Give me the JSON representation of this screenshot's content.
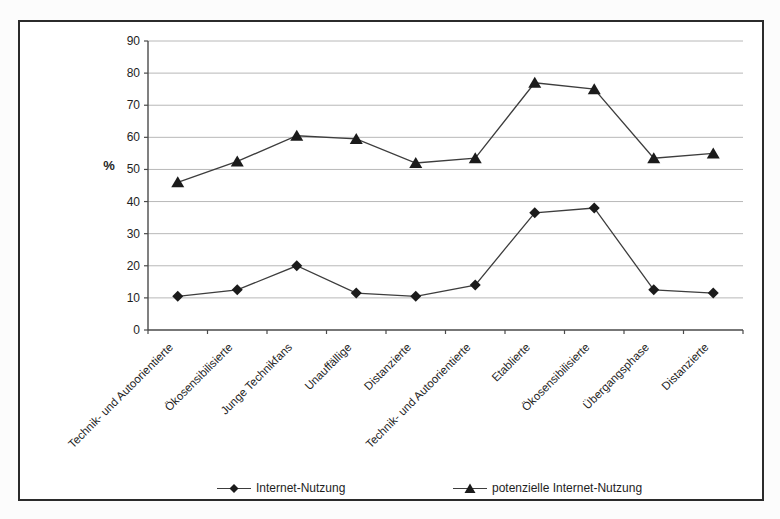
{
  "window": {
    "background": "#fcfcfc",
    "frame_border": "#2b2b2b"
  },
  "chart_data": {
    "type": "line",
    "title": "",
    "ylabel": "%",
    "xlabel": "",
    "ylim": [
      0,
      90
    ],
    "ytick_step": 10,
    "grid": true,
    "legend_position": "bottom",
    "categories": [
      "Technik- und Autoorientierte",
      "Ökosensibilisierte",
      "Junge Technikfans",
      "Unauffällige",
      "Distanzierte",
      "Technik- und Autoorientierte",
      "Etablierte",
      "Ökosensibilisierte",
      "Übergangsphase",
      "Distanzierte"
    ],
    "series": [
      {
        "name": "Internet-Nutzung",
        "marker": "diamond",
        "values": [
          10.5,
          12.5,
          20,
          11.5,
          10.5,
          14,
          36.5,
          38,
          12.5,
          11.5
        ]
      },
      {
        "name": "potenzielle Internet-Nutzung",
        "marker": "triangle",
        "values": [
          46,
          52.5,
          60.5,
          59.5,
          52,
          53.5,
          77,
          75,
          53.5,
          55
        ]
      }
    ],
    "colors": {
      "line": "#3d3d3d",
      "marker": "#1b1b1b",
      "grid": "#b8b8b8",
      "axis": "#4a4a4a",
      "text": "#1e1e1e"
    }
  }
}
